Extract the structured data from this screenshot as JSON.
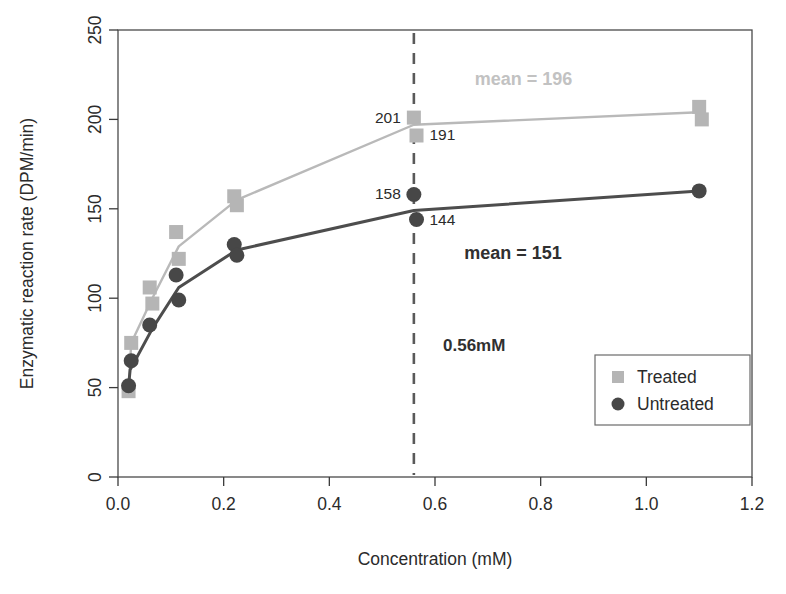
{
  "chart_data": {
    "type": "line",
    "title": "",
    "xlabel": "Concentration (mM)",
    "ylabel": "Enzymatic reaction rate (DPM/min)",
    "xlim": [
      0.0,
      1.2
    ],
    "ylim": [
      0,
      250
    ],
    "xticks": [
      "0.0",
      "0.2",
      "0.4",
      "0.6",
      "0.8",
      "1.0",
      "1.2"
    ],
    "xtick_values": [
      0.0,
      0.2,
      0.4,
      0.6,
      0.8,
      1.0,
      1.2
    ],
    "yticks": [
      "0",
      "50",
      "100",
      "150",
      "200",
      "250"
    ],
    "ytick_values": [
      0,
      50,
      100,
      150,
      200,
      250
    ],
    "grid": false,
    "legend_position": "lower-right",
    "series": [
      {
        "name": "Treated",
        "marker": "square",
        "color": "#b5b5b5",
        "points": [
          {
            "x": 0.02,
            "y": 48
          },
          {
            "x": 0.025,
            "y": 75
          },
          {
            "x": 0.06,
            "y": 106
          },
          {
            "x": 0.065,
            "y": 97
          },
          {
            "x": 0.11,
            "y": 137
          },
          {
            "x": 0.115,
            "y": 122
          },
          {
            "x": 0.22,
            "y": 157
          },
          {
            "x": 0.225,
            "y": 152
          },
          {
            "x": 0.56,
            "y": 201
          },
          {
            "x": 0.565,
            "y": 191
          },
          {
            "x": 1.1,
            "y": 207
          },
          {
            "x": 1.105,
            "y": 200
          }
        ],
        "trend": [
          {
            "x": 0.02,
            "y": 48
          },
          {
            "x": 0.025,
            "y": 75
          },
          {
            "x": 0.065,
            "y": 100
          },
          {
            "x": 0.115,
            "y": 129
          },
          {
            "x": 0.225,
            "y": 155
          },
          {
            "x": 0.56,
            "y": 197
          },
          {
            "x": 1.1,
            "y": 204
          }
        ]
      },
      {
        "name": "Untreated",
        "marker": "circle",
        "color": "#474747",
        "points": [
          {
            "x": 0.02,
            "y": 51
          },
          {
            "x": 0.025,
            "y": 65
          },
          {
            "x": 0.06,
            "y": 85
          },
          {
            "x": 0.11,
            "y": 113
          },
          {
            "x": 0.115,
            "y": 99
          },
          {
            "x": 0.22,
            "y": 130
          },
          {
            "x": 0.225,
            "y": 124
          },
          {
            "x": 0.56,
            "y": 158
          },
          {
            "x": 0.565,
            "y": 144
          },
          {
            "x": 1.1,
            "y": 160
          }
        ],
        "trend": [
          {
            "x": 0.02,
            "y": 51
          },
          {
            "x": 0.023,
            "y": 60
          },
          {
            "x": 0.065,
            "y": 83
          },
          {
            "x": 0.115,
            "y": 106
          },
          {
            "x": 0.225,
            "y": 127
          },
          {
            "x": 0.56,
            "y": 149
          },
          {
            "x": 1.1,
            "y": 160
          }
        ]
      }
    ],
    "annotations": [
      {
        "name": "point-label-201",
        "text": "201",
        "x": 0.56,
        "y": 201,
        "align": "right",
        "style": "plain"
      },
      {
        "name": "point-label-191",
        "text": "191",
        "x": 0.565,
        "y": 191,
        "align": "left",
        "style": "plain"
      },
      {
        "name": "point-label-158",
        "text": "158",
        "x": 0.56,
        "y": 158,
        "align": "right",
        "style": "plain"
      },
      {
        "name": "point-label-144",
        "text": "144",
        "x": 0.565,
        "y": 144,
        "align": "left",
        "style": "plain"
      },
      {
        "name": "mean-treated-label",
        "text": "mean = 196",
        "x": 0.66,
        "y": 222,
        "align": "left",
        "style": "mean-treated"
      },
      {
        "name": "mean-untreated-label",
        "text": "mean = 151",
        "x": 0.64,
        "y": 125,
        "align": "left",
        "style": "mean-untreated"
      },
      {
        "name": "vline-concentration-label",
        "text": "0.56mM",
        "x": 0.6,
        "y": 73,
        "align": "left",
        "style": "vline-label"
      }
    ],
    "vertical_line": {
      "name": "concentration-marker-line",
      "x": 0.56,
      "label": "0.56mM"
    },
    "legend_entries": [
      {
        "label": "Treated",
        "marker": "square",
        "color": "#b5b5b5"
      },
      {
        "label": "Untreated",
        "marker": "circle",
        "color": "#474747"
      }
    ]
  }
}
